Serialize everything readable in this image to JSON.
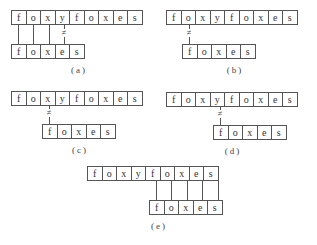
{
  "figure": {
    "text": [
      "f",
      "o",
      "x",
      "y",
      "f",
      "o",
      "x",
      "e",
      "s"
    ],
    "pattern": [
      "f",
      "o",
      "x",
      "e",
      "s"
    ],
    "neq_symbol": "≠",
    "panels": [
      {
        "id": "a",
        "caption": "(a)"
      },
      {
        "id": "b",
        "caption": "(b)"
      },
      {
        "id": "c",
        "caption": "(c)"
      },
      {
        "id": "d",
        "caption": "(d)"
      },
      {
        "id": "e",
        "caption": "(e)"
      }
    ]
  }
}
